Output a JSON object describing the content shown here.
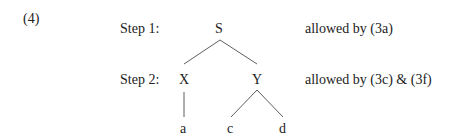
{
  "example_number": "(4)",
  "steps": [
    {
      "label": "Step 1:",
      "note": "allowed by (3a)"
    },
    {
      "label": "Step 2:",
      "note": "allowed by (3c) & (3f)"
    }
  ],
  "tree": {
    "root": "S",
    "children": [
      {
        "label": "X",
        "children": [
          {
            "label": "a"
          }
        ]
      },
      {
        "label": "Y",
        "children": [
          {
            "label": "c"
          },
          {
            "label": "d"
          }
        ]
      }
    ]
  }
}
